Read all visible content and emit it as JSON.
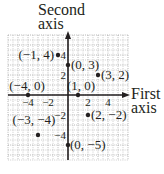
{
  "chart_data": {
    "type": "scatter",
    "title": "",
    "xlabel": "First axis",
    "ylabel": "Second axis",
    "xlabel_lines": [
      "First",
      "axis"
    ],
    "ylabel_lines": [
      "Second",
      "axis"
    ],
    "xlim": [
      -6,
      6
    ],
    "ylim": [
      -6.5,
      6
    ],
    "grid": true,
    "x_ticks": [
      -4,
      -2,
      2,
      4
    ],
    "y_ticks": [
      4,
      2,
      -2,
      -4
    ],
    "x_tick_labels": [
      "−4",
      "−2",
      "2",
      "4"
    ],
    "y_tick_labels": [
      "4",
      "2",
      "−2",
      "−4"
    ],
    "points": [
      {
        "x": -1,
        "y": 4,
        "label": "(−1, 4)"
      },
      {
        "x": 0,
        "y": 3,
        "label": "(0, 3)"
      },
      {
        "x": 3,
        "y": 2,
        "label": "(3, 2)"
      },
      {
        "x": -4,
        "y": 0,
        "label": "(−4, 0)"
      },
      {
        "x": 1,
        "y": 0,
        "label": "(1, 0)"
      },
      {
        "x": 2,
        "y": -2,
        "label": "(2, −2)"
      },
      {
        "x": -3,
        "y": -4,
        "label": "(−3, −4)"
      },
      {
        "x": 0,
        "y": -5,
        "label": "(0, −5)"
      }
    ]
  },
  "colors": {
    "ink": "#231f20",
    "grid": "#9a9a9a",
    "background": "#ffffff"
  }
}
